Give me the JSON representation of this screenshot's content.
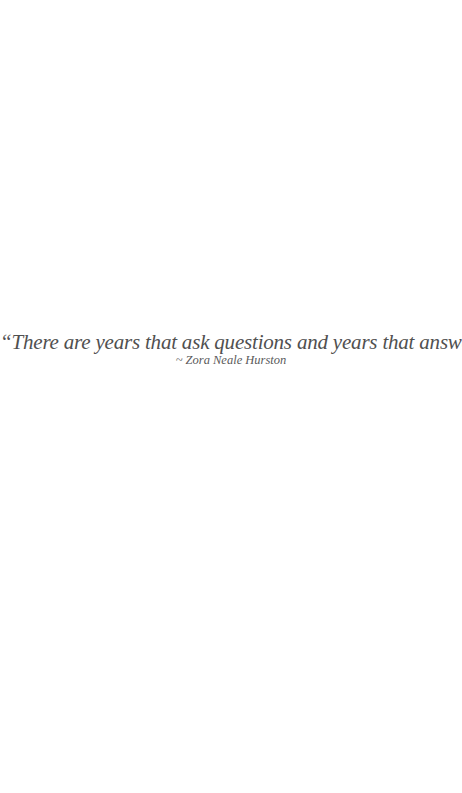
{
  "quote": {
    "text": "“There are years that ask questions and years that answer.”",
    "attribution": "~ Zora Neale Hurston"
  },
  "colors": {
    "background": "#ffffff",
    "text": "#505050"
  }
}
